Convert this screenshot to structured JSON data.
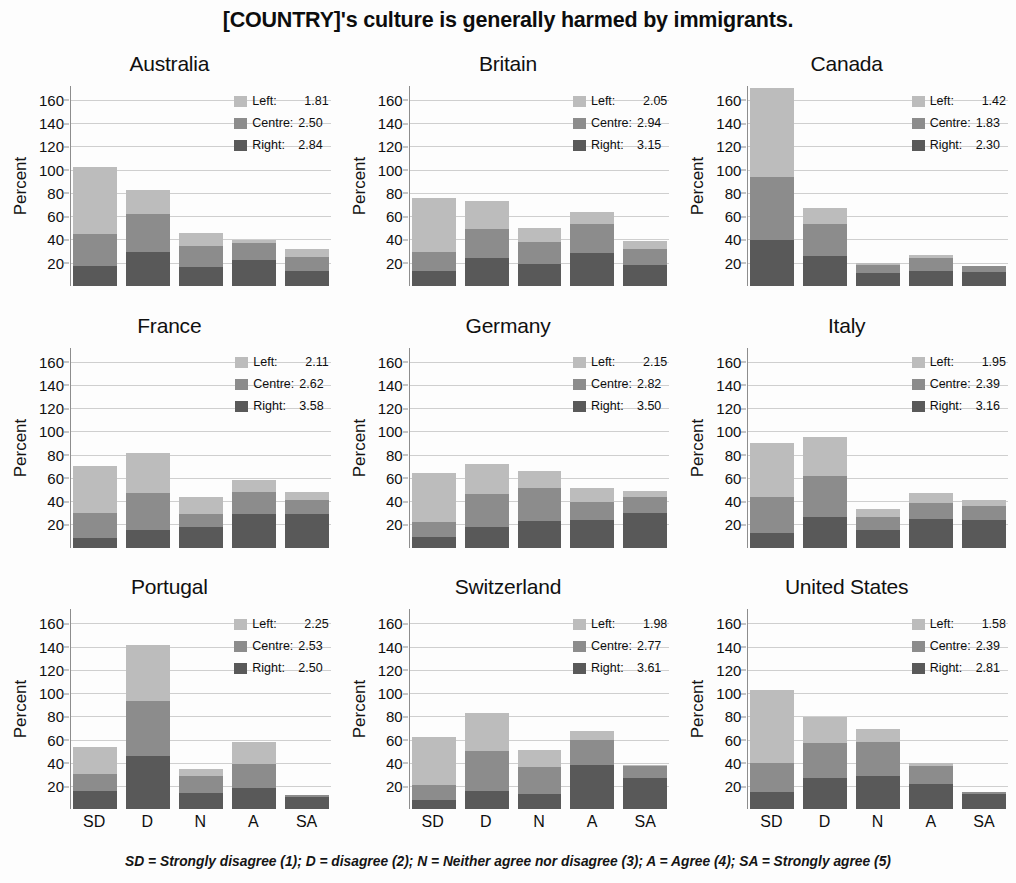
{
  "title": "[COUNTRY]'s culture is generally harmed by immigrants.",
  "footnote": "SD = Strongly disagree (1); D = disagree (2); N = Neither agree nor disagree (3); A = Agree (4); SA = Strongly agree (5)",
  "axis": {
    "ylabel": "Percent",
    "yticks": [
      20,
      40,
      60,
      80,
      100,
      120,
      140,
      160
    ],
    "ymax": 172,
    "xticks": [
      "SD",
      "D",
      "N",
      "A",
      "SA"
    ]
  },
  "legend": {
    "series": [
      "Left",
      "Centre",
      "Right"
    ],
    "labels": {
      "left": "Left:",
      "centre": "Centre:",
      "right": "Right:"
    }
  },
  "colors": {
    "left": "#bcbcbc",
    "centre": "#8c8c8c",
    "right": "#595959",
    "gridline": "#cfcfcf",
    "axis": "#8d8d8d"
  },
  "chart_data": {
    "type": "bar",
    "subtype": "stacked",
    "title": "[COUNTRY]'s culture is generally harmed by immigrants.",
    "xlabel": "",
    "ylabel": "Percent",
    "ylim": [
      0,
      172
    ],
    "yticks": [
      20,
      40,
      60,
      80,
      100,
      120,
      140,
      160
    ],
    "grid": true,
    "legend_position": "top-right inside panel",
    "categories": [
      "SD",
      "D",
      "N",
      "A",
      "SA"
    ],
    "series_names": [
      "Right",
      "Centre",
      "Left"
    ],
    "stack_order_bottom_to_top": [
      "Right",
      "Centre",
      "Left"
    ],
    "panels": [
      {
        "name": "Australia",
        "means": {
          "Left": 1.81,
          "Centre": 2.5,
          "Right": 2.84
        },
        "series": [
          {
            "name": "Right",
            "values": [
              17,
              29,
              16,
              22,
              13
            ]
          },
          {
            "name": "Centre",
            "values": [
              28,
              33,
              18,
              15,
              12
            ]
          },
          {
            "name": "Left",
            "values": [
              57,
              21,
              12,
              3,
              7
            ]
          }
        ],
        "totals": [
          102,
          83,
          46,
          40,
          32
        ]
      },
      {
        "name": "Britain",
        "means": {
          "Left": 2.05,
          "Centre": 2.94,
          "Right": 3.15
        },
        "series": [
          {
            "name": "Right",
            "values": [
              13,
              24,
              19,
              28,
              18
            ]
          },
          {
            "name": "Centre",
            "values": [
              16,
              25,
              19,
              25,
              14
            ]
          },
          {
            "name": "Left",
            "values": [
              47,
              24,
              12,
              11,
              7
            ]
          }
        ],
        "totals": [
          76,
          73,
          50,
          64,
          39
        ]
      },
      {
        "name": "Canada",
        "means": {
          "Left": 1.42,
          "Centre": 1.83,
          "Right": 2.3
        },
        "series": [
          {
            "name": "Right",
            "values": [
              40,
              26,
              11,
              13,
              12
            ]
          },
          {
            "name": "Centre",
            "values": [
              54,
              27,
              7,
              11,
              5
            ]
          },
          {
            "name": "Left",
            "values": [
              76,
              14,
              2,
              3,
              0
            ]
          }
        ],
        "totals": [
          170,
          67,
          20,
          27,
          17
        ]
      },
      {
        "name": "France",
        "means": {
          "Left": 2.11,
          "Centre": 2.62,
          "Right": 3.58
        },
        "series": [
          {
            "name": "Right",
            "values": [
              8,
              15,
              18,
              29,
              29
            ]
          },
          {
            "name": "Centre",
            "values": [
              22,
              32,
              11,
              19,
              12
            ]
          },
          {
            "name": "Left",
            "values": [
              40,
              34,
              15,
              10,
              7
            ]
          }
        ],
        "totals": [
          70,
          81,
          44,
          58,
          48
        ]
      },
      {
        "name": "Germany",
        "means": {
          "Left": 2.15,
          "Centre": 2.82,
          "Right": 3.5
        },
        "series": [
          {
            "name": "Right",
            "values": [
              9,
              18,
              23,
              24,
              30
            ]
          },
          {
            "name": "Centre",
            "values": [
              13,
              28,
              28,
              15,
              14
            ]
          },
          {
            "name": "Left",
            "values": [
              42,
              26,
              15,
              12,
              5
            ]
          }
        ],
        "totals": [
          64,
          72,
          66,
          51,
          49
        ]
      },
      {
        "name": "Italy",
        "means": {
          "Left": 1.95,
          "Centre": 2.39,
          "Right": 3.16
        },
        "series": [
          {
            "name": "Right",
            "values": [
              13,
              26,
              15,
              25,
              24
            ]
          },
          {
            "name": "Centre",
            "values": [
              31,
              36,
              11,
              13,
              12
            ]
          },
          {
            "name": "Left",
            "values": [
              46,
              33,
              7,
              9,
              5
            ]
          }
        ],
        "totals": [
          90,
          95,
          33,
          47,
          41
        ]
      },
      {
        "name": "Portugal",
        "means": {
          "Left": 2.25,
          "Centre": 2.53,
          "Right": 2.5
        },
        "series": [
          {
            "name": "Right",
            "values": [
              16,
              46,
              14,
              18,
              11
            ]
          },
          {
            "name": "Centre",
            "values": [
              14,
              47,
              15,
              21,
              1
            ]
          },
          {
            "name": "Left",
            "values": [
              24,
              48,
              6,
              19,
              0
            ]
          }
        ],
        "totals": [
          54,
          141,
          35,
          58,
          12
        ]
      },
      {
        "name": "Switzerland",
        "means": {
          "Left": 1.98,
          "Centre": 2.77,
          "Right": 3.61
        },
        "series": [
          {
            "name": "Right",
            "values": [
              8,
              16,
              13,
              38,
              27
            ]
          },
          {
            "name": "Centre",
            "values": [
              13,
              34,
              23,
              22,
              10
            ]
          },
          {
            "name": "Left",
            "values": [
              41,
              33,
              15,
              7,
              1
            ]
          }
        ],
        "totals": [
          62,
          83,
          51,
          67,
          38
        ]
      },
      {
        "name": "United States",
        "means": {
          "Left": 1.58,
          "Centre": 2.39,
          "Right": 2.81
        },
        "series": [
          {
            "name": "Right",
            "values": [
              15,
              27,
              29,
              22,
              13
            ]
          },
          {
            "name": "Centre",
            "values": [
              25,
              30,
              29,
              15,
              2
            ]
          },
          {
            "name": "Left",
            "values": [
              63,
              22,
              11,
              3,
              0
            ]
          }
        ],
        "totals": [
          103,
          79,
          69,
          40,
          15
        ]
      }
    ]
  }
}
